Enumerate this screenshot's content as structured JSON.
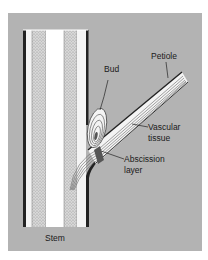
{
  "figure": {
    "type": "botanical-diagram",
    "background_color": "#b3b3b3",
    "labels": {
      "petiole": "Petiole",
      "bud": "Bud",
      "vascular_tissue_line1": "Vascular",
      "vascular_tissue_line2": "tissue",
      "abscission_line1": "Abscission",
      "abscission_line2": "layer",
      "stem": "Stem"
    }
  }
}
